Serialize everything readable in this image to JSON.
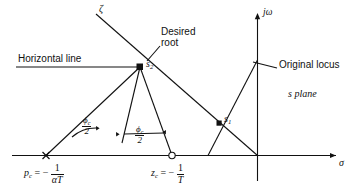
{
  "figure": {
    "kind": "s-plane root-locus lead-compensator design diagram",
    "plane_label": "s plane",
    "axes": {
      "real_axis_label": "σ",
      "imag_axis_label": "jω"
    },
    "annotations": {
      "horizontal_line": "Horizontal line",
      "desired_root_line1": "Desired",
      "desired_root_line2": "root",
      "original_locus": "Original locus",
      "damping_line": "ζ"
    },
    "points": {
      "s2": {
        "label_base": "s",
        "label_sub": "2",
        "marker": "filled-square"
      },
      "s1": {
        "label_base": "s",
        "label_sub": "1",
        "marker": "filled-square"
      },
      "pole": {
        "var": "p",
        "var_sub": "c",
        "eq": "= −",
        "num": "1",
        "den": "αT",
        "marker": "cross-x"
      },
      "zero": {
        "var": "z",
        "var_sub": "c",
        "eq": "= −",
        "num": "1",
        "den": "T",
        "marker": "open-circle"
      }
    },
    "angles": {
      "left": {
        "num": "ϕ",
        "num_sub": "c",
        "den": "2"
      },
      "right": {
        "num": "ϕ",
        "num_sub": "c",
        "den": "2"
      }
    },
    "colors": {
      "ink": "#111111",
      "background": "#ffffff"
    }
  }
}
